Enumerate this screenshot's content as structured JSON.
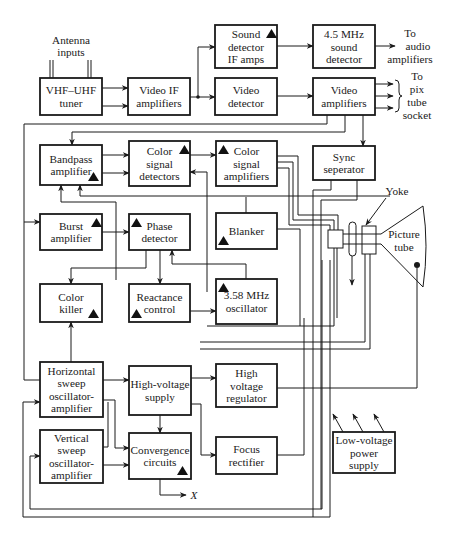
{
  "colors": {
    "ink": "#1a1a1a",
    "background": "#ffffff"
  },
  "blocks": [
    {
      "id": "tuner",
      "lines": [
        "VHF–UHF",
        "tuner"
      ],
      "x": 40,
      "y": 78,
      "w": 62,
      "h": 37,
      "tri": null
    },
    {
      "id": "video-if",
      "lines": [
        "Video IF",
        "amplifiers"
      ],
      "x": 128,
      "y": 78,
      "w": 62,
      "h": 37,
      "tri": null
    },
    {
      "id": "sound-detector",
      "lines": [
        "Sound",
        "detector",
        "IF amps"
      ],
      "x": 215,
      "y": 25,
      "w": 62,
      "h": 43,
      "tri": "tr"
    },
    {
      "id": "video-detector",
      "lines": [
        "Video",
        "detector"
      ],
      "x": 215,
      "y": 78,
      "w": 62,
      "h": 37,
      "tri": null
    },
    {
      "id": "sound-detector-45",
      "lines": [
        "4.5 MHz",
        "sound",
        "detector"
      ],
      "x": 313,
      "y": 25,
      "w": 62,
      "h": 43,
      "tri": null
    },
    {
      "id": "video-amplifiers",
      "lines": [
        "Video",
        "amplifiers"
      ],
      "x": 313,
      "y": 78,
      "w": 62,
      "h": 37,
      "tri": null
    },
    {
      "id": "bandpass-amplifier",
      "lines": [
        "Bandpass",
        "amplifier"
      ],
      "x": 40,
      "y": 145,
      "w": 62,
      "h": 40,
      "tri": "br"
    },
    {
      "id": "color-signal-detectors",
      "lines": [
        "Color",
        "signal",
        "detectors"
      ],
      "x": 129,
      "y": 141,
      "w": 61,
      "h": 45,
      "tri": "tr"
    },
    {
      "id": "color-signal-amplifiers",
      "lines": [
        "Color",
        "signal",
        "amplifiers"
      ],
      "x": 216,
      "y": 141,
      "w": 61,
      "h": 45,
      "tri": "tl"
    },
    {
      "id": "sync-separator",
      "lines": [
        "Sync",
        "seperator"
      ],
      "x": 313,
      "y": 146,
      "w": 62,
      "h": 34,
      "tri": null
    },
    {
      "id": "burst-amplifier",
      "lines": [
        "Burst",
        "amplifier"
      ],
      "x": 40,
      "y": 214,
      "w": 62,
      "h": 36,
      "tri": "tr"
    },
    {
      "id": "phase-detector",
      "lines": [
        "Phase",
        "detector"
      ],
      "x": 129,
      "y": 214,
      "w": 61,
      "h": 36,
      "tri": "tl"
    },
    {
      "id": "blanker",
      "lines": [
        "Blanker"
      ],
      "x": 216,
      "y": 213,
      "w": 61,
      "h": 36,
      "tri": "bl"
    },
    {
      "id": "color-killer",
      "lines": [
        "Color",
        "killer"
      ],
      "x": 40,
      "y": 284,
      "w": 62,
      "h": 38,
      "tri": "br"
    },
    {
      "id": "reactance-control",
      "lines": [
        "Reactance",
        "control"
      ],
      "x": 129,
      "y": 284,
      "w": 61,
      "h": 38,
      "tri": "bl"
    },
    {
      "id": "oscillator-358",
      "lines": [
        "3.58 MHz",
        "oscillator"
      ],
      "x": 216,
      "y": 279,
      "w": 61,
      "h": 45,
      "tri": "tl"
    },
    {
      "id": "horizontal-sweep",
      "lines": [
        "Horizontal",
        "sweep",
        "oscillator-",
        "amplifier"
      ],
      "x": 40,
      "y": 362,
      "w": 63,
      "h": 55,
      "tri": null
    },
    {
      "id": "high-voltage-supply",
      "lines": [
        "High-voltage",
        "supply"
      ],
      "x": 129,
      "y": 366,
      "w": 62,
      "h": 49,
      "tri": null
    },
    {
      "id": "high-voltage-regulator",
      "lines": [
        "High",
        "voltage",
        "regulator"
      ],
      "x": 216,
      "y": 364,
      "w": 61,
      "h": 43,
      "tri": null
    },
    {
      "id": "vertical-sweep",
      "lines": [
        "Vertical",
        "sweep",
        "oscillator-",
        "amplifier"
      ],
      "x": 40,
      "y": 430,
      "w": 63,
      "h": 53,
      "tri": null
    },
    {
      "id": "convergence-circuits",
      "lines": [
        "Convergence",
        "circuits"
      ],
      "x": 129,
      "y": 433,
      "w": 62,
      "h": 46,
      "tri": "br"
    },
    {
      "id": "focus-rectifier",
      "lines": [
        "Focus",
        "rectifier"
      ],
      "x": 216,
      "y": 437,
      "w": 61,
      "h": 37,
      "tri": null
    },
    {
      "id": "low-voltage-power-supply",
      "lines": [
        "Low-voltage",
        "power",
        "supply"
      ],
      "x": 333,
      "y": 432,
      "w": 62,
      "h": 41,
      "tri": null
    }
  ],
  "labels": {
    "antenna": [
      "Antenna",
      "inputs"
    ],
    "to_audio": [
      "To",
      "audio",
      "amplifiers"
    ],
    "to_pix": [
      "To",
      "pix",
      "tube",
      "socket"
    ],
    "yoke": "Yoke",
    "picture_tube": [
      "Picture",
      "tube"
    ],
    "x_output": "X"
  }
}
